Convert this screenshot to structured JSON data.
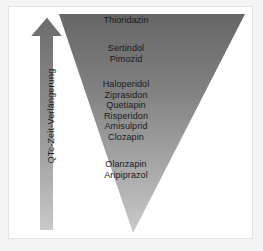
{
  "figure": {
    "background_color": "#f4f4f4",
    "frame_color": "#e2e2e2",
    "text_color": "#18181a"
  },
  "arrow": {
    "label": "QTc-Zeit-Verlängerung",
    "direction": "up",
    "outline_color": "#ffffff",
    "fill_top_color": "#6f6f6f",
    "fill_bottom_color": "#c8c8c8"
  },
  "triangle": {
    "orientation": "inverted",
    "gradient_top_color": "#6e6e6e",
    "gradient_bottom_color": "#c6c6c6"
  },
  "drug_groups": [
    {
      "group_name": "highest-risk",
      "drugs": [
        "Thioridazin"
      ]
    },
    {
      "group_name": "high-risk",
      "drugs": [
        "Sertindol",
        "Pimozid"
      ]
    },
    {
      "group_name": "moderate-risk",
      "drugs": [
        "Haloperidol",
        "Ziprasidon",
        "Quetiapin",
        "Risperidon",
        "Amisulprid",
        "Clozapin"
      ]
    },
    {
      "group_name": "low-risk",
      "drugs": [
        "Olanzapin",
        "Aripiprazol"
      ]
    }
  ]
}
